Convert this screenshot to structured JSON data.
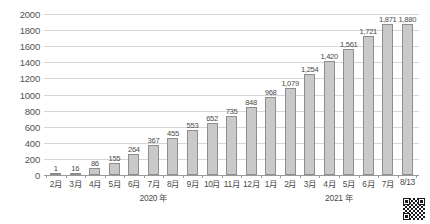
{
  "chart_data": {
    "type": "bar",
    "title": "",
    "subtitle": "",
    "xlabel": "",
    "ylabel": "",
    "ylim": [
      0,
      2000
    ],
    "grid": true,
    "legend": null,
    "categories": [
      "2月",
      "3月",
      "4月",
      "5月",
      "6月",
      "7月",
      "8月",
      "9月",
      "10月",
      "11月",
      "12月",
      "1月",
      "2月",
      "3月",
      "4月",
      "5月",
      "6月",
      "7月",
      "8/13"
    ],
    "values": [
      1,
      16,
      86,
      155,
      264,
      367,
      455,
      553,
      652,
      735,
      848,
      968,
      1079,
      1254,
      1420,
      1561,
      1721,
      1871,
      1880
    ],
    "value_labels": [
      "1",
      "16",
      "86",
      "155",
      "264",
      "367",
      "455",
      "553",
      "652",
      "735",
      "848",
      "968",
      "1,079",
      "1,254",
      "1,420",
      "1,561",
      "1,721",
      "1,871",
      "1,880"
    ],
    "y_ticks": [
      0,
      200,
      400,
      600,
      800,
      1000,
      1200,
      1400,
      1600,
      1800,
      2000
    ],
    "y_tick_labels": [
      "0",
      "200",
      "400",
      "600",
      "800",
      "1000",
      "1200",
      "1400",
      "1600",
      "1800",
      "2000"
    ],
    "group_captions": [
      {
        "label": "2020 年",
        "start_index": 0,
        "end_index": 10
      },
      {
        "label": "2021 年",
        "start_index": 11,
        "end_index": 18
      }
    ],
    "colors": {
      "bar_fill": "#c9c9c9",
      "bar_border": "#8e8e8e",
      "gridline": "#d6d6d6",
      "baseline": "#9a9a9a",
      "text": "#4a4a4a"
    }
  },
  "footer": {
    "qr_code_name": "qr-code"
  }
}
